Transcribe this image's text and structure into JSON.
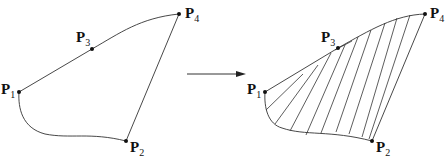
{
  "figure": {
    "arrow_label": "",
    "left": {
      "points": [
        {
          "name": "P",
          "sub": "1",
          "x": 19,
          "y": 92
        },
        {
          "name": "P",
          "sub": "2",
          "x": 126,
          "y": 141
        },
        {
          "name": "P",
          "sub": "3",
          "x": 92,
          "y": 49
        },
        {
          "name": "P",
          "sub": "4",
          "x": 179,
          "y": 14
        }
      ]
    },
    "right": {
      "points": [
        {
          "name": "P",
          "sub": "1",
          "x": 265,
          "y": 92
        },
        {
          "name": "P",
          "sub": "2",
          "x": 372,
          "y": 141
        },
        {
          "name": "P",
          "sub": "3",
          "x": 338,
          "y": 48
        },
        {
          "name": "P",
          "sub": "4",
          "x": 425,
          "y": 14
        }
      ],
      "hatch_line_count": 10
    },
    "colors": {
      "stroke": "#333333",
      "point": "#111111",
      "background": "#ffffff"
    }
  },
  "labels": {
    "L_P1": "P",
    "L_P1_sub": "1",
    "L_P2": "P",
    "L_P2_sub": "2",
    "L_P3": "P",
    "L_P3_sub": "3",
    "L_P4": "P",
    "L_P4_sub": "4",
    "R_P1": "P",
    "R_P1_sub": "1",
    "R_P2": "P",
    "R_P2_sub": "2",
    "R_P3": "P",
    "R_P3_sub": "3",
    "R_P4": "P",
    "R_P4_sub": "4"
  }
}
